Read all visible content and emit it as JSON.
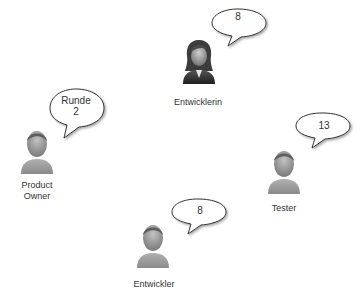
{
  "diagram": {
    "type": "planning-poker-team",
    "participants": [
      {
        "id": "entwicklerin",
        "label": "Entwicklerin",
        "bubble": "8",
        "gender": "female"
      },
      {
        "id": "product-owner",
        "label": "Product\nOwner",
        "bubble": "Runde\n2",
        "gender": "male"
      },
      {
        "id": "tester",
        "label": "Tester",
        "bubble": "13",
        "gender": "male"
      },
      {
        "id": "entwickler",
        "label": "Entwickler",
        "bubble": "8",
        "gender": "male"
      }
    ]
  },
  "colors": {
    "figure_body": "#9a9a9a",
    "figure_head": "#a0a0a0",
    "hair": "#6a6a6a",
    "bubble_fill": "#ffffff",
    "bubble_stroke": "#333333",
    "text": "#333333"
  }
}
